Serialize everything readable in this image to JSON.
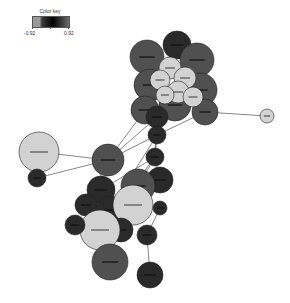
{
  "color_key": {
    "title": "Color key",
    "min_label": "-0.92",
    "max_label": "0.92"
  },
  "colors": {
    "light": "#d2d2d2",
    "mid": "#505050",
    "dark": "#2a2a2a",
    "edge": "#666666"
  },
  "graph": {
    "type": "network",
    "nodes": [
      {
        "x": 147,
        "y": 57,
        "r": 17,
        "c": "mid"
      },
      {
        "x": 177,
        "y": 45,
        "r": 14,
        "c": "dark"
      },
      {
        "x": 197,
        "y": 60,
        "r": 17,
        "c": "mid"
      },
      {
        "x": 150,
        "y": 85,
        "r": 16,
        "c": "mid"
      },
      {
        "x": 200,
        "y": 90,
        "r": 17,
        "c": "mid"
      },
      {
        "x": 175,
        "y": 105,
        "r": 16,
        "c": "mid"
      },
      {
        "x": 145,
        "y": 110,
        "r": 14,
        "c": "mid"
      },
      {
        "x": 205,
        "y": 112,
        "r": 13,
        "c": "mid"
      },
      {
        "x": 170,
        "y": 68,
        "r": 11,
        "c": "light"
      },
      {
        "x": 185,
        "y": 78,
        "r": 11,
        "c": "light"
      },
      {
        "x": 160,
        "y": 80,
        "r": 10,
        "c": "light"
      },
      {
        "x": 178,
        "y": 92,
        "r": 11,
        "c": "light"
      },
      {
        "x": 193,
        "y": 97,
        "r": 10,
        "c": "light"
      },
      {
        "x": 165,
        "y": 95,
        "r": 9,
        "c": "light"
      },
      {
        "x": 157,
        "y": 117,
        "r": 11,
        "c": "dark"
      },
      {
        "x": 267,
        "y": 116,
        "r": 7,
        "c": "light"
      },
      {
        "x": 157,
        "y": 135,
        "r": 9,
        "c": "dark"
      },
      {
        "x": 155,
        "y": 157,
        "r": 9,
        "c": "dark"
      },
      {
        "x": 108,
        "y": 160,
        "r": 16,
        "c": "mid"
      },
      {
        "x": 39,
        "y": 152,
        "r": 20,
        "c": "light"
      },
      {
        "x": 37,
        "y": 178,
        "r": 9,
        "c": "dark"
      },
      {
        "x": 160,
        "y": 180,
        "r": 13,
        "c": "dark"
      },
      {
        "x": 138,
        "y": 186,
        "r": 17,
        "c": "mid"
      },
      {
        "x": 101,
        "y": 190,
        "r": 14,
        "c": "dark"
      },
      {
        "x": 86,
        "y": 205,
        "r": 11,
        "c": "dark"
      },
      {
        "x": 110,
        "y": 210,
        "r": 14,
        "c": "dark"
      },
      {
        "x": 133,
        "y": 205,
        "r": 20,
        "c": "light"
      },
      {
        "x": 160,
        "y": 208,
        "r": 7,
        "c": "dark"
      },
      {
        "x": 147,
        "y": 235,
        "r": 10,
        "c": "dark"
      },
      {
        "x": 121,
        "y": 230,
        "r": 12,
        "c": "dark"
      },
      {
        "x": 100,
        "y": 230,
        "r": 20,
        "c": "light"
      },
      {
        "x": 75,
        "y": 225,
        "r": 10,
        "c": "dark"
      },
      {
        "x": 110,
        "y": 262,
        "r": 18,
        "c": "mid"
      },
      {
        "x": 150,
        "y": 275,
        "r": 13,
        "c": "dark"
      }
    ],
    "edges": [
      [
        16,
        7
      ],
      [
        16,
        14
      ],
      [
        17,
        14
      ],
      [
        17,
        16
      ],
      [
        21,
        17
      ],
      [
        22,
        21
      ],
      [
        22,
        17
      ],
      [
        18,
        14
      ],
      [
        18,
        16
      ],
      [
        18,
        6
      ],
      [
        19,
        18
      ],
      [
        20,
        18
      ],
      [
        7,
        15
      ],
      [
        23,
        17
      ],
      [
        25,
        16
      ],
      [
        26,
        21
      ],
      [
        28,
        33
      ],
      [
        28,
        27
      ],
      [
        24,
        18
      ],
      [
        30,
        17
      ]
    ]
  }
}
